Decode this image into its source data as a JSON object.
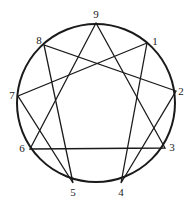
{
  "diagram": {
    "circle": {
      "cx": 96,
      "cy": 103,
      "r": 79,
      "stroke": "#1a1a1a"
    },
    "points": [
      {
        "label": "9",
        "x": 96,
        "y": 23,
        "lx": 96,
        "ly": 18
      },
      {
        "label": "1",
        "x": 147,
        "y": 43,
        "lx": 155,
        "ly": 45
      },
      {
        "label": "2",
        "x": 176,
        "y": 91,
        "lx": 181,
        "ly": 95
      },
      {
        "label": "3",
        "x": 165,
        "y": 148,
        "lx": 172,
        "ly": 151
      },
      {
        "label": "4",
        "x": 121,
        "y": 183,
        "lx": 121,
        "ly": 196
      },
      {
        "label": "5",
        "x": 73,
        "y": 183,
        "lx": 73,
        "ly": 196
      },
      {
        "label": "6",
        "x": 30,
        "y": 149,
        "lx": 22,
        "ly": 152
      },
      {
        "label": "7",
        "x": 18,
        "y": 96,
        "lx": 12,
        "ly": 99
      },
      {
        "label": "8",
        "x": 44,
        "y": 45,
        "lx": 39,
        "ly": 44
      }
    ],
    "triangle": [
      "9",
      "3",
      "6"
    ],
    "hexad": [
      "1",
      "4",
      "2",
      "8",
      "5",
      "7",
      "1"
    ]
  }
}
